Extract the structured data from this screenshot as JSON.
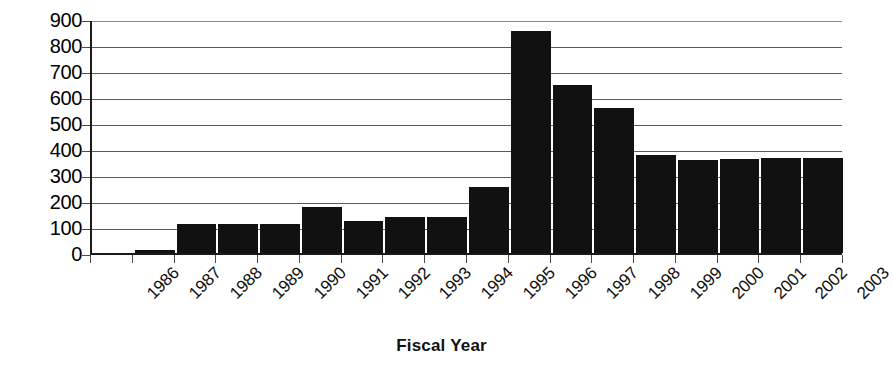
{
  "chart_data": {
    "type": "bar",
    "title": "",
    "xlabel": "Fiscal Year",
    "ylabel": "",
    "categories": [
      "1986",
      "1987",
      "1988",
      "1989",
      "1990",
      "1991",
      "1992",
      "1993",
      "1994",
      "1995",
      "1996",
      "1997",
      "1998",
      "1999",
      "2000",
      "2001",
      "2002",
      "2003"
    ],
    "values": [
      0,
      12,
      112,
      112,
      112,
      178,
      122,
      140,
      140,
      255,
      855,
      645,
      558,
      378,
      358,
      362,
      365,
      365
    ],
    "ylim": [
      0,
      900
    ],
    "ytick_labels": [
      "900",
      "800",
      "700",
      "600",
      "500",
      "400",
      "300",
      "200",
      "100",
      "0"
    ],
    "ytick_values": [
      900,
      800,
      700,
      600,
      500,
      400,
      300,
      200,
      100,
      0
    ],
    "grid": true,
    "legend": "none",
    "bar_color": "#111111",
    "axis_color": "#1a1a1a",
    "gridline_color": "#5c5c5c"
  }
}
